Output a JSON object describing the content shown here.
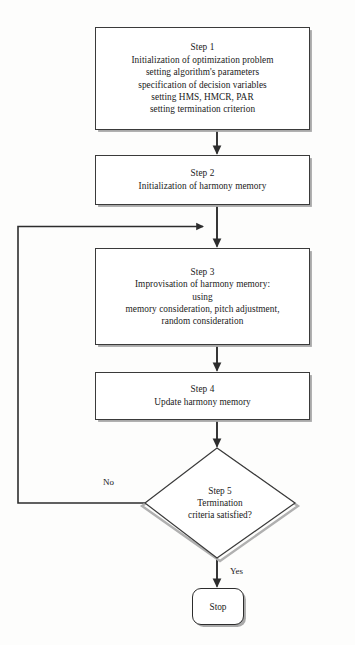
{
  "diagram": {
    "type": "flowchart",
    "background_color": "#fdfdfc",
    "line_color": "#3a3a3a",
    "box_fill": "#ffffff"
  },
  "nodes": {
    "step1": {
      "shape": "process",
      "lines": [
        "Step 1",
        "Initialization of optimization problem",
        "setting algorithm's parameters",
        "specification of decision variables",
        "setting HMS, HMCR, PAR",
        "setting termination criterion"
      ]
    },
    "step2": {
      "shape": "process",
      "lines": [
        "Step 2",
        "Initialization of harmony memory"
      ]
    },
    "step3": {
      "shape": "process",
      "lines": [
        "Step 3",
        "Improvisation of harmony memory:",
        "using",
        "memory consideration, pitch adjustment,",
        "random consideration"
      ]
    },
    "step4": {
      "shape": "process",
      "lines": [
        "Step 4",
        "Update harmony memory"
      ]
    },
    "step5": {
      "shape": "decision",
      "lines": [
        "Step 5",
        "Termination",
        "criteria satisfied?"
      ]
    },
    "stop": {
      "shape": "terminator",
      "label": "Stop"
    }
  },
  "edges": {
    "no_label": "No",
    "yes_label": "Yes"
  }
}
